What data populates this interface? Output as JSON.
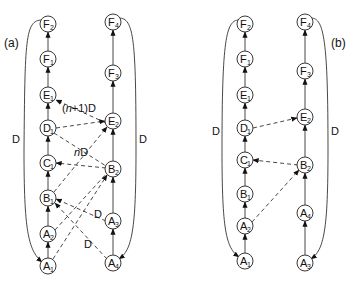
{
  "panels": {
    "a": {
      "label": "(a)",
      "left_nodes": [
        {
          "id": "F2",
          "letter": "F",
          "sub": "2",
          "x": 48,
          "y": 24
        },
        {
          "id": "F1",
          "letter": "F",
          "sub": "1",
          "x": 48,
          "y": 59
        },
        {
          "id": "E1",
          "letter": "E",
          "sub": "1",
          "x": 48,
          "y": 95
        },
        {
          "id": "D1",
          "letter": "D",
          "sub": "1",
          "x": 48,
          "y": 128
        },
        {
          "id": "C1",
          "letter": "C",
          "sub": "1",
          "x": 48,
          "y": 163
        },
        {
          "id": "B1",
          "letter": "B",
          "sub": "1",
          "x": 48,
          "y": 198
        },
        {
          "id": "A2",
          "letter": "A",
          "sub": "2",
          "x": 48,
          "y": 234
        },
        {
          "id": "A1",
          "letter": "A",
          "sub": "1",
          "x": 48,
          "y": 266
        }
      ],
      "right_nodes": [
        {
          "id": "F4",
          "letter": "F",
          "sub": "4",
          "x": 113,
          "y": 22
        },
        {
          "id": "F3",
          "letter": "F",
          "sub": "3",
          "x": 113,
          "y": 73
        },
        {
          "id": "E2",
          "letter": "E",
          "sub": "2",
          "x": 113,
          "y": 121
        },
        {
          "id": "B2",
          "letter": "B",
          "sub": "2",
          "x": 113,
          "y": 169
        },
        {
          "id": "A3",
          "letter": "A",
          "sub": "3",
          "x": 113,
          "y": 221
        },
        {
          "id": "A4",
          "letter": "A",
          "sub": "4",
          "x": 113,
          "y": 263
        }
      ],
      "edge_labels": {
        "left_loop": "D",
        "right_loop": "D",
        "n1D": "(n+1)D",
        "nD": "nD",
        "d_upper": "D",
        "d_lower": "D"
      }
    },
    "b": {
      "label": "(b)",
      "left_nodes": [
        {
          "id": "F2",
          "letter": "F",
          "sub": "2",
          "x": 245,
          "y": 24
        },
        {
          "id": "F1",
          "letter": "F",
          "sub": "1",
          "x": 245,
          "y": 59
        },
        {
          "id": "E1",
          "letter": "E",
          "sub": "1",
          "x": 245,
          "y": 95
        },
        {
          "id": "D1",
          "letter": "D",
          "sub": "1",
          "x": 245,
          "y": 128
        },
        {
          "id": "C1",
          "letter": "C",
          "sub": "1",
          "x": 245,
          "y": 160
        },
        {
          "id": "B1",
          "letter": "B",
          "sub": "1",
          "x": 245,
          "y": 194
        },
        {
          "id": "A2",
          "letter": "A",
          "sub": "2",
          "x": 245,
          "y": 226
        },
        {
          "id": "A1",
          "letter": "A",
          "sub": "1",
          "x": 245,
          "y": 261
        }
      ],
      "right_nodes": [
        {
          "id": "F4",
          "letter": "F",
          "sub": "4",
          "x": 305,
          "y": 22
        },
        {
          "id": "F3",
          "letter": "F",
          "sub": "3",
          "x": 305,
          "y": 71
        },
        {
          "id": "E2",
          "letter": "E",
          "sub": "2",
          "x": 305,
          "y": 117
        },
        {
          "id": "B2",
          "letter": "B",
          "sub": "2",
          "x": 305,
          "y": 165
        },
        {
          "id": "A4",
          "letter": "A",
          "sub": "4",
          "x": 305,
          "y": 213
        },
        {
          "id": "A3",
          "letter": "A",
          "sub": "3",
          "x": 305,
          "y": 263
        }
      ],
      "edge_labels": {
        "left_loop": "D",
        "right_loop": "D"
      }
    }
  }
}
